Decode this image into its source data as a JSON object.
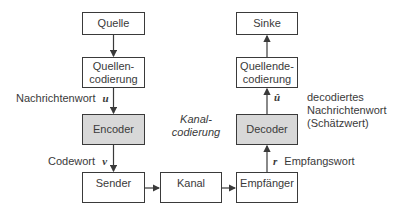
{
  "diagram": {
    "type": "block-diagram",
    "title": "",
    "left_chain": {
      "source": "Quelle",
      "source_coding": [
        "Quellen-",
        "codierung"
      ],
      "encoder": "Encoder",
      "transmitter": "Sender"
    },
    "channel": "Kanal",
    "right_chain": {
      "receiver": "Empfänger",
      "decoder": "Decoder",
      "source_decoding": [
        "Quellende-",
        "codierung"
      ],
      "sink": "Sinke"
    },
    "labels": {
      "message_word": "Nachrichtenwort",
      "message_symbol": "u",
      "code_word": "Codewort",
      "code_symbol": "v",
      "received_symbol": "r",
      "received_word": "Empfangswort",
      "estimate_symbol": "û",
      "decoded_line1": "decodiertes",
      "decoded_line2": "Nachrichtenwort",
      "decoded_line3": "(Schätzwert)",
      "channel_coding_line1": "Kanal-",
      "channel_coding_line2": "codierung"
    },
    "colors": {
      "highlight_fill": "#d8d8d8",
      "stroke": "#3a3a3a"
    }
  }
}
